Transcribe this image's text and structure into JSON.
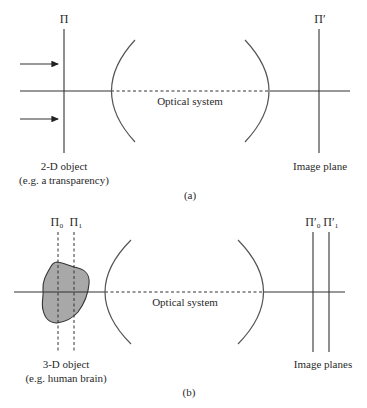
{
  "panel_a": {
    "caption": "(a)",
    "object_plane_label": "Π",
    "image_plane_label": "Π′",
    "optical_system_label": "Optical system",
    "object_label_line1": "2-D object",
    "object_label_line2": "(e.g. a transparency)",
    "image_label": "Image plane",
    "incoming_arrows": 2
  },
  "panel_b": {
    "caption": "(b)",
    "object_plane_labels": [
      "Π₀",
      "Π₁"
    ],
    "image_plane_labels": [
      "Π′₀",
      "Π′₁"
    ],
    "optical_system_label": "Optical system",
    "object_label_line1": "3-D object",
    "object_label_line2": "(e.g. human brain)",
    "image_label": "Image planes"
  },
  "colors": {
    "line": "#333333",
    "object_fill": "#a8a8a8",
    "background": "#ffffff"
  }
}
